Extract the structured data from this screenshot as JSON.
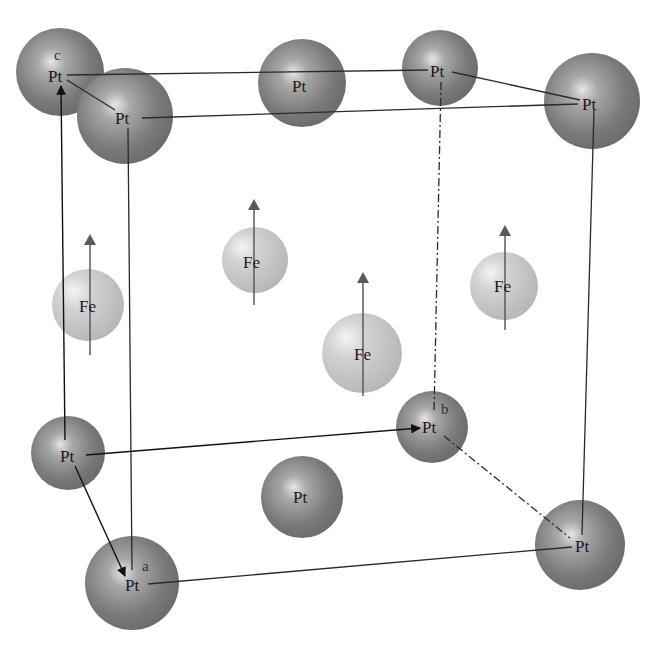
{
  "diagram": {
    "title": "",
    "type": "crystal-structure",
    "colors": {
      "pt_fill_dark": "#6e6e6e",
      "pt_fill_light": "#d8d8d8",
      "fe_fill_dark": "#b4b4b4",
      "fe_fill_light": "#efefef",
      "edge_line": "#2a2a2a",
      "spin_arrow": "#5a5a5a",
      "axis_arrow": "#111111"
    },
    "axes": {
      "a": "a",
      "b": "b",
      "c": "c"
    },
    "atoms": {
      "pt_top_back_left": {
        "label": "Pt",
        "x": 60,
        "y": 72,
        "r": 44
      },
      "pt_top_front_left": {
        "label": "Pt",
        "x": 125,
        "y": 116,
        "r": 50
      },
      "pt_top_face": {
        "label": "Pt",
        "x": 302,
        "y": 83,
        "r": 44
      },
      "pt_top_back_right": {
        "label": "Pt",
        "x": 440,
        "y": 68,
        "r": 38
      },
      "pt_top_front_right": {
        "label": "Pt",
        "x": 592,
        "y": 101,
        "r": 48
      },
      "pt_bot_back_left": {
        "label": "Pt",
        "x": 68,
        "y": 453,
        "r": 38
      },
      "pt_bot_back_right": {
        "label": "Pt",
        "x": 432,
        "y": 427,
        "r": 36
      },
      "pt_bot_face": {
        "label": "Pt",
        "x": 302,
        "y": 497,
        "r": 42
      },
      "pt_bot_front_left": {
        "label": "Pt",
        "x": 132,
        "y": 583,
        "r": 48
      },
      "pt_bot_front_right": {
        "label": "Pt",
        "x": 580,
        "y": 545,
        "r": 46
      },
      "fe_left": {
        "label": "Fe",
        "x": 88,
        "y": 305,
        "r": 36
      },
      "fe_back": {
        "label": "Fe",
        "x": 255,
        "y": 260,
        "r": 33
      },
      "fe_center": {
        "label": "Fe",
        "x": 362,
        "y": 353,
        "r": 40
      },
      "fe_right": {
        "label": "Fe",
        "x": 504,
        "y": 286,
        "r": 34
      }
    },
    "spins": [
      {
        "atom": "fe_left",
        "x": 90,
        "y_top": 235,
        "y_bottom": 355
      },
      {
        "atom": "fe_back",
        "x": 254,
        "y_top": 200,
        "y_bottom": 305
      },
      {
        "atom": "fe_center",
        "x": 363,
        "y_top": 272,
        "y_bottom": 396
      },
      {
        "atom": "fe_right",
        "x": 505,
        "y_top": 225,
        "y_bottom": 330
      }
    ]
  }
}
